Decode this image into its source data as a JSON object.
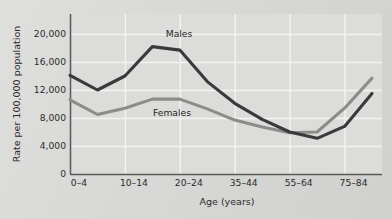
{
  "chart_data": {
    "type": "line",
    "title": "",
    "xlabel": "Age (years)",
    "ylabel": "Rate per 100,000 population",
    "ylim": [
      0,
      22000
    ],
    "yticks": [
      0,
      4000,
      8000,
      12000,
      16000,
      20000
    ],
    "ytick_labels": [
      "0",
      "4,000",
      "8,000",
      "12,000",
      "16,000",
      "20,000"
    ],
    "grid": "both",
    "legend_position": "inline-labels",
    "categories": [
      "0–4",
      "5–9",
      "10–14",
      "15–19",
      "20–24",
      "25–34",
      "35–44",
      "45–54",
      "55–64",
      "65–74",
      "75–84",
      "85+"
    ],
    "xtick_labels_shown": [
      "0–4",
      "10–14",
      "20–24",
      "35–44",
      "55–64",
      "75–84"
    ],
    "series": [
      {
        "name": "Males",
        "color": "#3a3a3a",
        "values": [
          14100,
          12000,
          14000,
          18200,
          17700,
          13200,
          10100,
          7800,
          6000,
          5100,
          6800,
          11500
        ]
      },
      {
        "name": "Females",
        "color": "#8c8c8a",
        "values": [
          10600,
          8500,
          9400,
          10700,
          10700,
          9300,
          7700,
          6700,
          5900,
          6000,
          9400,
          13700
        ]
      }
    ],
    "annotations": [
      {
        "text": "Males",
        "series": "Males"
      },
      {
        "text": "Females",
        "series": "Females"
      }
    ]
  },
  "colors": {
    "page_background": "#d7d7d5",
    "plot_background": "#dcdcda",
    "gridline": "#f3f3f1",
    "axis": "#5a5a58",
    "males_line": "#3a3a3a",
    "females_line": "#8c8c8a",
    "text": "#2b2b2b"
  }
}
